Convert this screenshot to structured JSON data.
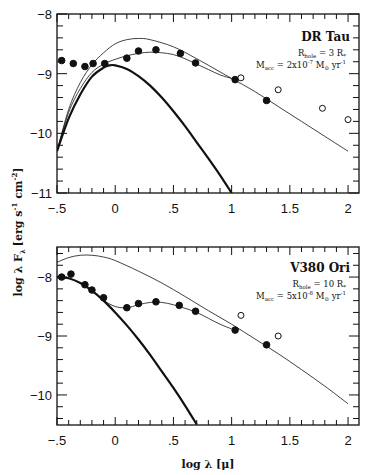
{
  "figure": {
    "xlabel": "log λ [μ]",
    "ylabel": "log λ F_λ [erg s^-1 cm^-2]",
    "ylabel_parts": {
      "main": "log λ F",
      "sub": "λ",
      "units": "[erg s",
      "sup1": "-1",
      "units2": " cm",
      "sup2": "-2",
      "close": "]"
    }
  },
  "panels": [
    {
      "star": "DR Tau",
      "r_hole": "R",
      "r_hole_sub": "hole",
      "r_hole_val": " = 3 R",
      "r_hole_unit_sub": "*",
      "m_acc": "M",
      "m_acc_sub": "acc",
      "m_acc_val": " = 2x10",
      "m_acc_exp": "-7",
      "m_acc_unit": " M",
      "m_acc_unit_sub": "⊙",
      "m_acc_yr": " yr",
      "m_acc_yr_exp": "-1",
      "x_ticks": [
        "-.5",
        "0",
        ".5",
        "1",
        "1.5",
        "2"
      ],
      "y_ticks": [
        "-8",
        "-9",
        "-10",
        "-11"
      ]
    },
    {
      "star": "V380 Ori",
      "r_hole": "R",
      "r_hole_sub": "hole",
      "r_hole_val": " = 10 R",
      "r_hole_unit_sub": "*",
      "m_acc": "M",
      "m_acc_sub": "acc",
      "m_acc_val": " = 5x10",
      "m_acc_exp": "-8",
      "m_acc_unit": " M",
      "m_acc_unit_sub": "⊙",
      "m_acc_yr": " yr",
      "m_acc_yr_exp": "-1",
      "x_ticks": [
        "-.5",
        "0",
        ".5",
        "1",
        "1.5",
        "2"
      ],
      "y_ticks": [
        "-8",
        "-9",
        "-10"
      ]
    }
  ],
  "chart_data": [
    {
      "type": "line",
      "title": "DR Tau",
      "xlabel": "log λ [μ]",
      "ylabel": "log λ F_λ [erg s^-1 cm^-2]",
      "xlim": [
        -0.5,
        2.1
      ],
      "ylim": [
        -11,
        -8
      ],
      "annotations": [
        "R_hole = 3 R_*",
        "M_acc = 2x10^-7 M_⊙ yr^-1"
      ],
      "series": [
        {
          "name": "observed (filled)",
          "style": "filled-circle",
          "x": [
            -0.46,
            -0.36,
            -0.26,
            -0.19,
            -0.09,
            0.1,
            0.2,
            0.35,
            0.56,
            0.69,
            1.03,
            1.3
          ],
          "y": [
            -8.78,
            -8.83,
            -8.88,
            -8.83,
            -8.83,
            -8.74,
            -8.62,
            -8.6,
            -8.66,
            -8.82,
            -9.1,
            -9.45
          ]
        },
        {
          "name": "observed (open)",
          "style": "open-circle",
          "x": [
            1.08,
            1.4,
            1.78,
            2.0
          ],
          "y": [
            -9.07,
            -9.27,
            -9.58,
            -9.77
          ]
        },
        {
          "name": "stellar photosphere",
          "style": "thick-line",
          "x": [
            -0.5,
            -0.4,
            -0.3,
            -0.2,
            -0.1,
            -0.05,
            0.0,
            0.1,
            0.2,
            0.3,
            0.4,
            0.5,
            0.6,
            0.7,
            0.8,
            0.9,
            1.0
          ],
          "y": [
            -10.3,
            -9.75,
            -9.35,
            -9.05,
            -8.9,
            -8.86,
            -8.86,
            -8.92,
            -9.04,
            -9.2,
            -9.4,
            -9.63,
            -9.88,
            -10.15,
            -10.42,
            -10.7,
            -11.0
          ]
        },
        {
          "name": "model (upper thin)",
          "style": "thin-line",
          "x": [
            -0.5,
            -0.4,
            -0.3,
            -0.2,
            -0.1,
            0.0,
            0.1,
            0.2,
            0.3,
            0.5,
            0.7,
            0.9,
            1.0,
            1.2,
            1.4,
            1.6,
            1.8,
            2.0
          ],
          "y": [
            -10.3,
            -9.6,
            -9.15,
            -8.85,
            -8.65,
            -8.5,
            -8.43,
            -8.41,
            -8.43,
            -8.55,
            -8.75,
            -8.97,
            -9.08,
            -9.3,
            -9.55,
            -9.8,
            -10.05,
            -10.3
          ]
        },
        {
          "name": "model fit (middle thin)",
          "style": "thin-line",
          "x": [
            -0.5,
            -0.4,
            -0.3,
            -0.2,
            -0.1,
            0.0,
            0.1,
            0.2,
            0.3,
            0.4,
            0.5,
            0.6,
            0.7,
            0.8,
            0.9,
            1.0
          ],
          "y": [
            -10.3,
            -9.65,
            -9.25,
            -8.98,
            -8.84,
            -8.76,
            -8.7,
            -8.66,
            -8.64,
            -8.65,
            -8.68,
            -8.75,
            -8.84,
            -8.93,
            -9.02,
            -9.08
          ]
        }
      ]
    },
    {
      "type": "line",
      "title": "V380 Ori",
      "xlabel": "log λ [μ]",
      "ylabel": "log λ F_λ [erg s^-1 cm^-2]",
      "xlim": [
        -0.5,
        2.1
      ],
      "ylim": [
        -10.5,
        -7.5
      ],
      "annotations": [
        "R_hole = 10 R_*",
        "M_acc = 5x10^-8 M_⊙ yr^-1"
      ],
      "series": [
        {
          "name": "observed (filled)",
          "style": "filled-circle",
          "x": [
            -0.46,
            -0.38,
            -0.26,
            -0.2,
            -0.1,
            0.1,
            0.2,
            0.35,
            0.55,
            0.69,
            1.03,
            1.3
          ],
          "y": [
            -8.0,
            -7.95,
            -8.13,
            -8.22,
            -8.35,
            -8.52,
            -8.45,
            -8.42,
            -8.48,
            -8.58,
            -8.9,
            -9.15
          ]
        },
        {
          "name": "observed (open)",
          "style": "open-circle",
          "x": [
            1.08,
            1.4
          ],
          "y": [
            -8.65,
            -9.0
          ]
        },
        {
          "name": "stellar photosphere",
          "style": "thick-line",
          "x": [
            -0.5,
            -0.4,
            -0.3,
            -0.2,
            -0.1,
            0.0,
            0.1,
            0.2,
            0.3,
            0.4,
            0.5,
            0.6,
            0.7
          ],
          "y": [
            -8.0,
            -8.02,
            -8.1,
            -8.23,
            -8.4,
            -8.6,
            -8.82,
            -9.06,
            -9.32,
            -9.6,
            -9.88,
            -10.18,
            -10.5
          ]
        },
        {
          "name": "model (upper thin)",
          "style": "thin-line",
          "x": [
            -0.5,
            -0.4,
            -0.3,
            -0.2,
            -0.1,
            0.0,
            0.2,
            0.4,
            0.6,
            0.8,
            1.0,
            1.2,
            1.4,
            1.6,
            1.8,
            2.0
          ],
          "y": [
            -7.75,
            -7.67,
            -7.63,
            -7.63,
            -7.66,
            -7.72,
            -7.9,
            -8.1,
            -8.33,
            -8.57,
            -8.8,
            -9.05,
            -9.3,
            -9.57,
            -9.85,
            -10.15
          ]
        },
        {
          "name": "model fit (middle thin)",
          "style": "thin-line",
          "x": [
            -0.1,
            0.0,
            0.1,
            0.2,
            0.3,
            0.4,
            0.5,
            0.6,
            0.7,
            0.8,
            0.9,
            1.0
          ],
          "y": [
            -8.4,
            -8.5,
            -8.52,
            -8.47,
            -8.43,
            -8.43,
            -8.47,
            -8.53,
            -8.6,
            -8.7,
            -8.8,
            -8.88
          ]
        }
      ]
    }
  ]
}
